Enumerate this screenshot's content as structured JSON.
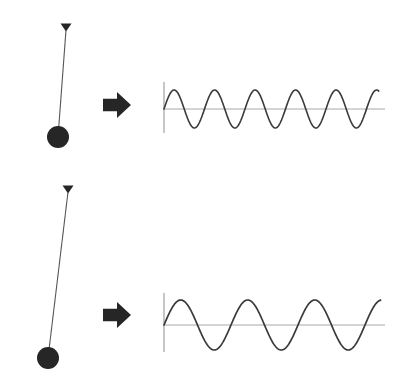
{
  "figure": {
    "width": 402,
    "height": 386,
    "background_color": "#ffffff",
    "stroke_color": "#2b2b2b",
    "axis_color": "#a8a8a8",
    "bob_color": "#262626"
  },
  "rows": [
    {
      "id": "short-pendulum-row",
      "label": "Short pendulum produces a high frequency wave",
      "pendulum": {
        "name": "short-pendulum",
        "pivot": {
          "x": 66,
          "y": 30
        },
        "bob": {
          "x": 58,
          "y": 137,
          "radius": 11
        },
        "string_length": 107,
        "tilt_degrees": 4,
        "pivot_marker": "triangle-down"
      },
      "arrow": {
        "name": "transform-arrow-top",
        "direction": "right",
        "x": 103,
        "y": 92,
        "width": 28,
        "height": 26
      },
      "plot": {
        "name": "waveform-short-pendulum",
        "origin": {
          "x": 164,
          "y": 109
        },
        "axis_top": 82,
        "axis_bottom": 133,
        "baseline_end_x": 385,
        "wave_end_x": 379,
        "amplitude": 19,
        "period": 40.5,
        "cycles": 5,
        "phase": "sine"
      }
    },
    {
      "id": "long-pendulum-row",
      "label": "Long pendulum produces a low frequency wave",
      "pendulum": {
        "name": "long-pendulum",
        "pivot": {
          "x": 68,
          "y": 192
        },
        "bob": {
          "x": 48,
          "y": 358,
          "radius": 11
        },
        "string_length": 167,
        "tilt_degrees": 7,
        "pivot_marker": "triangle-down"
      },
      "arrow": {
        "name": "transform-arrow-bottom",
        "direction": "right",
        "x": 103,
        "y": 302,
        "width": 28,
        "height": 26
      },
      "plot": {
        "name": "waveform-long-pendulum",
        "origin": {
          "x": 164,
          "y": 325
        },
        "axis_top": 293,
        "axis_bottom": 352,
        "baseline_end_x": 385,
        "wave_end_x": 381,
        "amplitude": 25,
        "period": 67,
        "cycles": 3.2,
        "phase": "sine"
      }
    }
  ],
  "chart_data": {
    "type": "line",
    "xlabel": "",
    "ylabel": "",
    "grid": false,
    "legend": "none",
    "series": [
      {
        "name": "short-pendulum-wave",
        "description": "Displacement of short pendulum over time",
        "waveform": "sine",
        "amplitude_px": 19,
        "period_px": 40.5,
        "cycles": 5,
        "x_range_px": [
          164,
          379
        ],
        "baseline_y_px": 109
      },
      {
        "name": "long-pendulum-wave",
        "description": "Displacement of long pendulum over time",
        "waveform": "sine",
        "amplitude_px": 25,
        "period_px": 67,
        "cycles": 3.2,
        "x_range_px": [
          164,
          381
        ],
        "baseline_y_px": 325
      }
    ]
  }
}
